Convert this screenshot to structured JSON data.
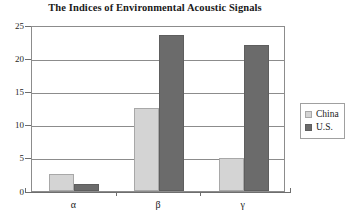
{
  "chart_data": {
    "type": "bar",
    "title": "The Indices of Environmental Acoustic Signals",
    "xlabel": "",
    "ylabel": "",
    "categories": [
      "α",
      "β",
      "γ"
    ],
    "series": [
      {
        "name": "China",
        "color": "#d4d4d4",
        "values": [
          2.5,
          12.5,
          5.0
        ]
      },
      {
        "name": "U.S.",
        "color": "#6b6b6b",
        "values": [
          1.0,
          23.5,
          22.0
        ]
      }
    ],
    "ylim": [
      0,
      25
    ],
    "yticks": [
      0,
      5,
      10,
      15,
      20,
      25
    ],
    "ytick_labels": [
      "0",
      "5",
      "10",
      "15",
      "20",
      "25"
    ],
    "grid": true,
    "grid_axis": "y",
    "legend": {
      "position": "right",
      "entries": [
        {
          "label": "China",
          "color": "#d4d4d4"
        },
        {
          "label": "U.S.",
          "color": "#6b6b6b"
        }
      ]
    }
  }
}
